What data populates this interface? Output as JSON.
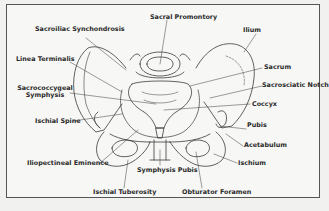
{
  "figure": {
    "labels": {
      "sacroiliac_synchondrosis": "Sacroiliac Synchondrosis",
      "sacral_promontory": "Sacral Promontory",
      "ilium": "Ilium",
      "linea_terminalis": "Linea Terminalis",
      "sacrum": "Sacrum",
      "sacrococcygeal_symphysis_line1": "Sacrococcygeal",
      "sacrococcygeal_symphysis_line2": "Symphysis",
      "sacrosciatic_notch": "Sacrosciatic Notch",
      "coccyx": "Coccyx",
      "ischial_spine": "Ischial Spine",
      "pubis": "Pubis",
      "acetabulum": "Acetabulum",
      "iliopectineal_eminence": "Iliopectineal Eminence",
      "symphysis_pubis": "Symphysis Pubis",
      "ischium": "Ischium",
      "ischial_tuberosity": "Ischial Tuberosity",
      "obturator_foramen": "Obturator Foramen"
    },
    "colors": {
      "line": "#3a3a3a",
      "background": "#f7f7f5",
      "border": "#555555"
    }
  }
}
